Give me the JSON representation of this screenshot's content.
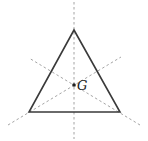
{
  "diagram": {
    "title": "",
    "triangle": {
      "type": "equilateral",
      "vertices": [
        {
          "name": "top",
          "x": 74,
          "y": 30
        },
        {
          "name": "bottom-left",
          "x": 29,
          "y": 112
        },
        {
          "name": "bottom-right",
          "x": 120,
          "y": 112
        }
      ],
      "stroke_color": "#3a3a3a"
    },
    "medians": [
      {
        "name": "vertical-median",
        "x1": 74,
        "y1": 2,
        "x2": 74,
        "y2": 139
      },
      {
        "name": "median-from-bottom-left",
        "x1": 8,
        "y1": 125,
        "x2": 121,
        "y2": 57
      },
      {
        "name": "median-from-bottom-right",
        "x1": 140,
        "y1": 125,
        "x2": 29,
        "y2": 58
      }
    ],
    "median_color": "#9a9a9a",
    "centroid": {
      "label": "G",
      "x": 74,
      "y": 85
    }
  }
}
